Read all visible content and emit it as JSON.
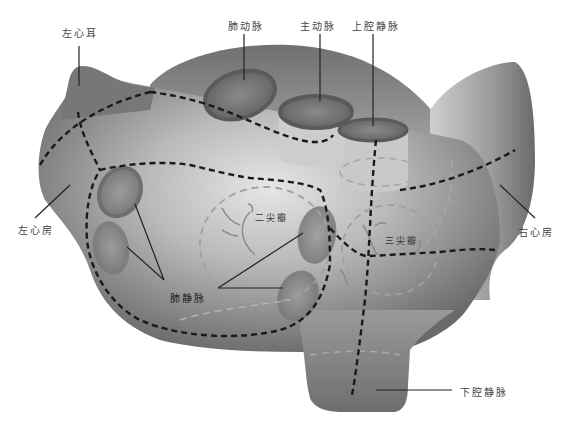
{
  "labels": {
    "left_auricle": "左心耳",
    "pulmonary_artery": "肺动脉",
    "aorta": "主动脉",
    "superior_vena_cava": "上腔静脉",
    "left_atrium": "左心房",
    "right_atrium": "右心房",
    "mitral_valve": "二尖瓣",
    "tricuspid_valve": "三尖瓣",
    "pulmonary_veins": "肺静脉",
    "inferior_vena_cava": "下腔静脉"
  },
  "colors": {
    "heart_dark": "#6f6f6f",
    "heart_light": "#d8d8d8",
    "vessel_ring": "#5a5a5a",
    "dash_line": "#1a1a1a",
    "valve_dash": "#a0a0a0",
    "label_text": "#444444"
  }
}
